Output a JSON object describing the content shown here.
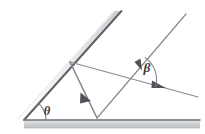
{
  "figure": {
    "background_color": "#ffffff",
    "width": 205,
    "height": 134,
    "labels": {
      "incline_angle": "θ",
      "ray_angle": "β"
    },
    "colors": {
      "ray_stroke": "#8a8d93",
      "mirror_line": "#5c5f66",
      "mirror_body_light": "#f0f0f1",
      "mirror_body_mid": "#d9dadc",
      "mirror_body_dark": "#bfc1c4",
      "label_text": "#3a3c41",
      "arc_stroke": "#7c7f85"
    }
  },
  "geometry": {
    "inclined_mirror": {
      "name": "inclined-mirror",
      "vertex": [
        24,
        120
      ],
      "top_end": [
        121,
        11
      ],
      "thickness_px": 7,
      "angle_deg": 48
    },
    "horizontal_mirror": {
      "name": "horizontal-mirror",
      "left_end": [
        24,
        120
      ],
      "right_end": [
        200,
        120
      ],
      "thickness_px": 8
    },
    "incident_ray": {
      "name": "incident-ray",
      "start": [
        186,
        14
      ],
      "end": [
        97,
        118
      ],
      "arrow_at": [
        140,
        64
      ]
    },
    "reflected_ray_up": {
      "name": "reflected-ray-to-incline",
      "start": [
        97,
        118
      ],
      "end": [
        70,
        62
      ]
    },
    "reflected_ray_down": {
      "name": "reflected-ray-from-incline",
      "start": [
        70,
        62
      ],
      "end": [
        97,
        118
      ],
      "arrow_at": [
        87,
        97
      ]
    },
    "exit_ray": {
      "name": "exit-ray",
      "start": [
        70,
        62
      ],
      "end": [
        198,
        97
      ],
      "arrow_at": [
        162,
        87
      ]
    },
    "theta_arc": {
      "name": "theta-angle-arc",
      "center": [
        24,
        120
      ],
      "radius": 22,
      "label_pos": [
        48,
        111
      ]
    },
    "beta_arc": {
      "name": "beta-angle-arc",
      "center": [
        131,
        80
      ],
      "radius": 26,
      "label_pos": [
        146,
        67
      ]
    }
  }
}
